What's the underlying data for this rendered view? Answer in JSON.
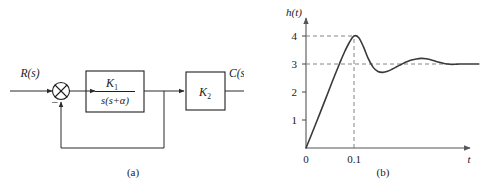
{
  "figure": {
    "caption_a": "(a)",
    "caption_b": "(b)"
  },
  "block_diagram": {
    "input_label": "R(s)",
    "output_label": "C(s)",
    "summing_junction": {
      "icon": "circle-x-summing-junction",
      "feedback_sign": "−"
    },
    "blocks": [
      {
        "name": "plant-block",
        "numerator": "K",
        "numerator_sub": "1",
        "denominator": "s(s+α)"
      },
      {
        "name": "gain-block",
        "gain": "K",
        "gain_sub": "2"
      }
    ]
  },
  "chart_data": {
    "type": "line",
    "title": "",
    "xlabel": "t",
    "ylabel": "h(t)",
    "xlim": [
      0,
      0.36
    ],
    "ylim": [
      0,
      4.55
    ],
    "grid": false,
    "legend": null,
    "xticks": [
      0,
      0.1
    ],
    "xticklabels": [
      "0",
      "0.1"
    ],
    "yticks": [
      1,
      2,
      3,
      4
    ],
    "yticklabels": [
      "1",
      "2",
      "3",
      "4"
    ],
    "annotations": [
      {
        "name": "peak-guide-horizontal",
        "type": "dashed-line",
        "y": 4,
        "label": "4"
      },
      {
        "name": "steady-state-guide-horizontal",
        "type": "dashed-line",
        "y": 3,
        "label": "3"
      },
      {
        "name": "peak-time-guide-vertical",
        "type": "dashed-line",
        "x": 0.1,
        "label": "0.1"
      }
    ],
    "peak_value": 4,
    "peak_time": 0.1,
    "steady_state": 3,
    "series": [
      {
        "name": "step-response",
        "x": [
          0.0,
          0.01,
          0.02,
          0.03,
          0.04,
          0.05,
          0.06,
          0.07,
          0.08,
          0.09,
          0.1,
          0.11,
          0.12,
          0.13,
          0.14,
          0.15,
          0.16,
          0.17,
          0.18,
          0.19,
          0.2,
          0.21,
          0.22,
          0.23,
          0.24,
          0.25,
          0.26,
          0.27,
          0.28,
          0.29,
          0.3,
          0.31,
          0.32,
          0.33,
          0.34,
          0.35,
          0.36
        ],
        "y": [
          0.0,
          0.42,
          0.85,
          1.28,
          1.72,
          2.16,
          2.6,
          3.02,
          3.42,
          3.76,
          4.0,
          3.94,
          3.6,
          3.18,
          2.88,
          2.73,
          2.7,
          2.74,
          2.82,
          2.91,
          3.0,
          3.08,
          3.14,
          3.18,
          3.2,
          3.19,
          3.15,
          3.1,
          3.05,
          3.01,
          2.99,
          2.99,
          3.0,
          3.0,
          3.0,
          3.0,
          3.0
        ]
      }
    ]
  }
}
